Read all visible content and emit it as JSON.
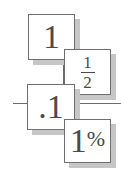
{
  "cards": [
    {
      "id": "whole",
      "value": "1"
    },
    {
      "id": "fraction",
      "numerator": "1",
      "denominator": "2"
    },
    {
      "id": "decimal",
      "value": ".1"
    },
    {
      "id": "percent",
      "value": "1",
      "symbol": "%"
    }
  ]
}
